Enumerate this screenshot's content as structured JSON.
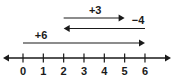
{
  "figure": {
    "type": "number-line-diagram",
    "background_color": "#ffffff",
    "ink_color": "#1a1a1a"
  },
  "chart_data": {
    "type": "number-line",
    "title": "",
    "xlabel": "",
    "ylabel": "",
    "axis": {
      "min": 0,
      "max": 6,
      "tick_step": 1,
      "tick_labels": [
        "0",
        "1",
        "2",
        "3",
        "4",
        "5",
        "6"
      ],
      "tick_values": [
        0,
        1,
        2,
        3,
        4,
        5,
        6
      ],
      "left_arrow": true,
      "right_arrow": true,
      "grid": false
    },
    "jumps": [
      {
        "label": "+3",
        "value": 3,
        "start": 2,
        "end": 5,
        "direction": "right",
        "row": 0
      },
      {
        "label": "−4",
        "value": -4,
        "start": 6,
        "end": 2,
        "direction": "left",
        "row": 1
      },
      {
        "label": "+6",
        "value": 6,
        "start": 0,
        "end": 6,
        "direction": "right",
        "row": 2
      }
    ]
  }
}
